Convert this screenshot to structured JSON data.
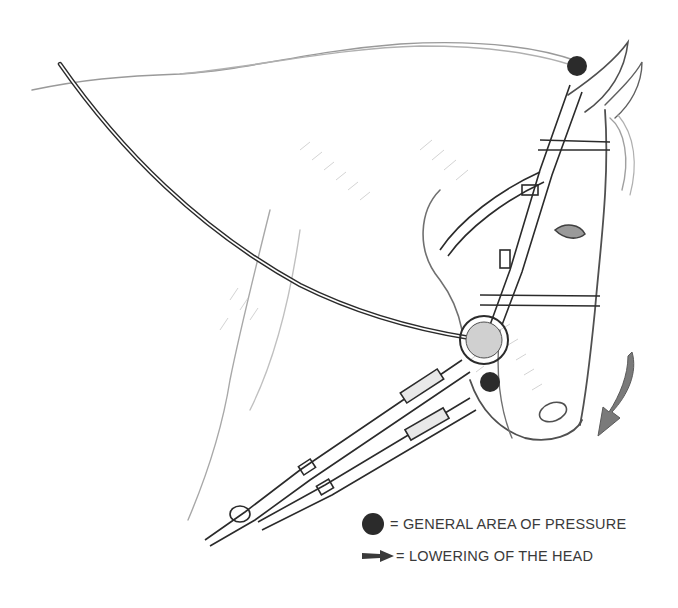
{
  "figure": {
    "colors": {
      "ink": "#2b2b2b",
      "pencil": "#8a8a8a",
      "arrow": "#7a7a7a",
      "pressure_dot": "#2b2b2b",
      "background": "#ffffff"
    },
    "markers": [
      {
        "type": "pressure-point",
        "location": "poll (top of head behind ears)"
      },
      {
        "type": "pressure-point",
        "location": "chin / bit area"
      },
      {
        "type": "direction-arrow",
        "location": "in front of muzzle, pointing down-left"
      }
    ]
  },
  "legend": {
    "items": [
      {
        "symbol": "dot",
        "label": "= GENERAL AREA OF PRESSURE"
      },
      {
        "symbol": "arrow",
        "label": "= LOWERING OF THE HEAD"
      }
    ]
  }
}
